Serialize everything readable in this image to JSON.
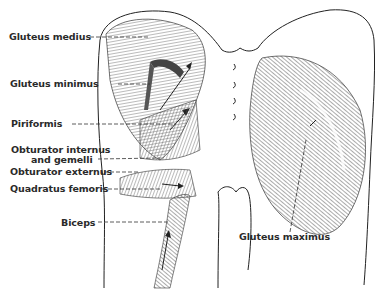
{
  "figure": {
    "type": "anatomical illustration",
    "colors": {
      "ink": "#2a2a2a",
      "background": "#ffffff",
      "hatch": "#555555"
    }
  },
  "labels": {
    "gluteus_medius": "Gluteus medius",
    "gluteus_minimus": "Gluteus minimus",
    "piriformis": "Piriformis",
    "obturator_internus_line1": "Obturator internus",
    "obturator_internus_line2": "and gemelli",
    "obturator_externus": "Obturator externus",
    "quadratus_femoris": "Quadratus femoris",
    "biceps": "Biceps",
    "gluteus_maximus": "Gluteus maximus"
  }
}
